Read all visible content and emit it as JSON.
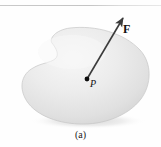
{
  "figure": {
    "caption": "(a)",
    "background_color": "#fefefe",
    "rule_color": "#c7c7c7",
    "body": {
      "name": "rigid-body-blob",
      "fill_light": "#f2f2f2",
      "fill_mid": "#e3e3e3",
      "fill_dark": "#cfcfcf",
      "outline_color": "#c6c6c6",
      "shadow_color": "#d8d8d8"
    },
    "point": {
      "label": "P",
      "dot_color": "#0d0d0d",
      "x": 87,
      "y": 79
    },
    "force_vector": {
      "label": "F",
      "color": "#3b3b3b",
      "tail_x": 87,
      "tail_y": 79,
      "tip_x": 124,
      "tip_y": 16
    }
  }
}
